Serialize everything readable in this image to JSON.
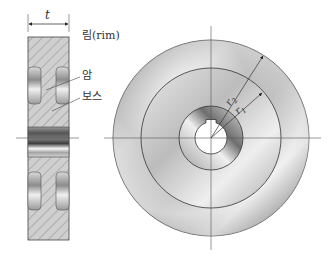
{
  "figure": {
    "type": "flywheel-drawing",
    "views": [
      "cross-section",
      "front-view"
    ]
  },
  "labels": {
    "thickness": "t",
    "rim": "림(rim)",
    "arm": "암",
    "boss": "보스",
    "r2_main": "r",
    "r2_sub": "2",
    "r1_main": "r",
    "r1_sub": "1"
  },
  "colors": {
    "line": "#333333",
    "hatch": "#8a8a8a",
    "section_fill": "#c8c8c8",
    "metal_dark": "#6e6e6e",
    "metal_light": "#f2f2f2"
  }
}
